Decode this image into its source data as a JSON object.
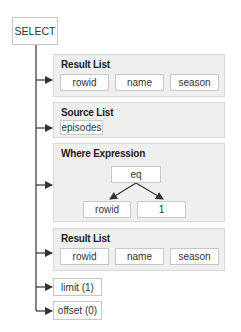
{
  "root": {
    "label": "SELECT"
  },
  "result_list_1": {
    "title": "Result List",
    "items": [
      "rowid",
      "name",
      "season"
    ]
  },
  "source_list": {
    "title": "Source List",
    "items": [
      "episodes"
    ]
  },
  "where_expression": {
    "title": "Where Expression",
    "operator": "eq",
    "operands": [
      "rowid",
      "1"
    ]
  },
  "result_list_2": {
    "title": "Result List",
    "items": [
      "rowid",
      "name",
      "season"
    ]
  },
  "limit": {
    "label": "limit (1)"
  },
  "offset": {
    "label": "offset (0)"
  },
  "colors": {
    "line": "#333333",
    "panel_bg": "#efefef",
    "box_border": "#c8c8c8"
  }
}
